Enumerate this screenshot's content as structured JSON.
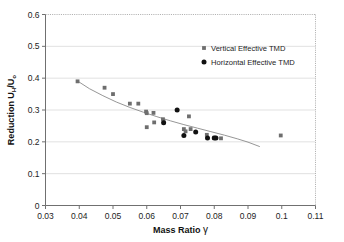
{
  "figure": {
    "background_color": "#ffffff",
    "frame_color": "#8c8c8c",
    "grid_color": "#d9d9d9"
  },
  "chart_data": {
    "type": "scatter",
    "title": "",
    "xlabel": "Mass Ratio",
    "xlabel_symbol": "γ",
    "ylabel": "Reduction U",
    "ylabel_sub1": "H",
    "ylabel_mid": "/U",
    "ylabel_sub2": "o",
    "xlim": [
      0.03,
      0.11
    ],
    "ylim": [
      0,
      0.6
    ],
    "xticks": [
      0.03,
      0.04,
      0.05,
      0.06,
      0.07,
      0.08,
      0.09,
      0.1,
      0.11
    ],
    "xtick_labels": [
      "0.03",
      "0.04",
      "0.05",
      "0.06",
      "0.07",
      "0.08",
      "0.09",
      "0.1",
      "0.11"
    ],
    "yticks": [
      0,
      0.1,
      0.2,
      0.3,
      0.4,
      0.5,
      0.6
    ],
    "ytick_labels": [
      "0",
      "0.1",
      "0.2",
      "0.3",
      "0.4",
      "0.5",
      "0.6"
    ],
    "grid": "horizontal",
    "legend_position": "upper-right",
    "series": [
      {
        "name": "Vertical Effective TMD",
        "marker": "square",
        "color": "#6e6e6e",
        "points": [
          [
            0.0395,
            0.39
          ],
          [
            0.0475,
            0.37
          ],
          [
            0.05,
            0.35
          ],
          [
            0.055,
            0.32
          ],
          [
            0.0575,
            0.32
          ],
          [
            0.0598,
            0.295
          ],
          [
            0.06,
            0.29
          ],
          [
            0.06,
            0.246
          ],
          [
            0.062,
            0.291
          ],
          [
            0.0622,
            0.261
          ],
          [
            0.0648,
            0.271
          ],
          [
            0.065,
            0.264
          ],
          [
            0.071,
            0.24
          ],
          [
            0.0715,
            0.233
          ],
          [
            0.0725,
            0.28
          ],
          [
            0.073,
            0.24
          ],
          [
            0.0778,
            0.222
          ],
          [
            0.08,
            0.213
          ],
          [
            0.082,
            0.211
          ],
          [
            0.0997,
            0.22
          ]
        ]
      },
      {
        "name": "Horizontal Effective TMD",
        "marker": "circle",
        "color": "#111111",
        "points": [
          [
            0.065,
            0.26
          ],
          [
            0.069,
            0.3
          ],
          [
            0.071,
            0.22
          ],
          [
            0.0745,
            0.231
          ],
          [
            0.078,
            0.212
          ],
          [
            0.08,
            0.212
          ],
          [
            0.0805,
            0.212
          ]
        ]
      }
    ],
    "trendline": {
      "name": "fitted power curve",
      "color": "#8a8a8a",
      "x_start": 0.0395,
      "x_end": 0.0935,
      "points": [
        [
          0.0395,
          0.391
        ],
        [
          0.043,
          0.367
        ],
        [
          0.047,
          0.345
        ],
        [
          0.051,
          0.325
        ],
        [
          0.055,
          0.308
        ],
        [
          0.059,
          0.293
        ],
        [
          0.063,
          0.279
        ],
        [
          0.067,
          0.266
        ],
        [
          0.071,
          0.254
        ],
        [
          0.075,
          0.243
        ],
        [
          0.079,
          0.232
        ],
        [
          0.083,
          0.221
        ],
        [
          0.087,
          0.209
        ],
        [
          0.09,
          0.199
        ],
        [
          0.0935,
          0.185
        ]
      ]
    },
    "legend": [
      {
        "label": "Vertical Effective TMD",
        "marker": "square",
        "color": "#6e6e6e"
      },
      {
        "label": "Horizontal Effective TMD",
        "marker": "circle",
        "color": "#111111"
      }
    ]
  }
}
